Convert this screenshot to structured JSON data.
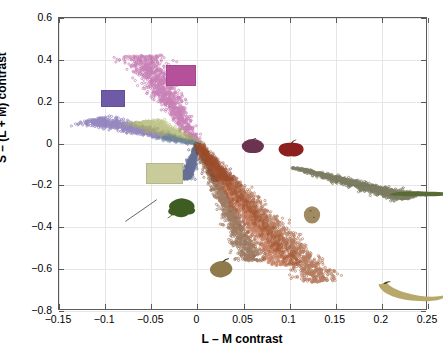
{
  "figure": {
    "xlabel": "L – M contrast",
    "ylabel": "S – (L + M) contrast",
    "background": "#ffffff",
    "axis_color": "#5a5a5a",
    "grid_color": "#e6e6e6"
  },
  "chart_data": {
    "type": "scatter",
    "title": "",
    "xlabel": "L – M contrast",
    "ylabel": "S – (L + M) contrast",
    "xlim": [
      -0.15,
      0.25
    ],
    "ylim": [
      -0.8,
      0.6
    ],
    "xticks": [
      -0.15,
      -0.1,
      -0.05,
      0,
      0.05,
      0.1,
      0.15,
      0.2,
      0.25
    ],
    "xticklabels": [
      "−0.15",
      "−0.1",
      "−0.05",
      "0",
      "0.05",
      "0.1",
      "0.15",
      "0.2",
      "0.25"
    ],
    "yticks": [
      -0.8,
      -0.6,
      -0.4,
      -0.2,
      0,
      0.2,
      0.4,
      0.6
    ],
    "yticklabels": [
      "−0.8",
      "−0.6",
      "−0.4",
      "−0.2",
      "0",
      "0.2",
      "0.4",
      "0.6"
    ],
    "grid": true,
    "legend": "none",
    "marker": "circle-open",
    "marker_size": 2.4,
    "series": [
      {
        "name": "blue-purple-cloud-upper-left",
        "color": "#6f5aa8",
        "n": 900,
        "origin": [
          0.0,
          0.0
        ],
        "direction": [
          -0.115,
          0.115
        ],
        "spread_long": 0.055,
        "spread_perp": 0.022,
        "center": [
          -0.072,
          0.075
        ],
        "x_range": [
          -0.125,
          -0.015
        ],
        "y_range": [
          0.015,
          0.135
        ]
      },
      {
        "name": "magenta-cloud-upper-middle",
        "color": "#b5519b",
        "n": 1100,
        "origin": [
          0.0,
          0.0
        ],
        "direction": [
          -0.062,
          0.42
        ],
        "spread_long": 0.09,
        "spread_perp": 0.02,
        "center": [
          -0.035,
          0.23
        ],
        "x_range": [
          -0.072,
          0.0
        ],
        "y_range": [
          0.02,
          0.44
        ]
      },
      {
        "name": "olive-green-cloud-center",
        "color": "#a8b060",
        "n": 950,
        "origin": [
          0.0,
          0.0
        ],
        "direction": [
          -0.06,
          0.105
        ],
        "spread_long": 0.05,
        "spread_perp": 0.018,
        "center": [
          -0.032,
          0.055
        ],
        "x_range": [
          -0.068,
          0.004
        ],
        "y_range": [
          -0.015,
          0.125
        ]
      },
      {
        "name": "dark-navy-cloud-near-origin",
        "color": "#2b3a6b",
        "n": 600,
        "origin": [
          0.0,
          0.0
        ],
        "direction": [
          -0.012,
          -0.17
        ],
        "spread_long": 0.075,
        "spread_perp": 0.006,
        "center": [
          -0.006,
          -0.09
        ],
        "x_range": [
          -0.016,
          0.004
        ],
        "y_range": [
          -0.19,
          0.01
        ]
      },
      {
        "name": "dark-red-cloud-right-of-origin",
        "color": "#6d2330",
        "n": 750,
        "origin": [
          0.0,
          0.0
        ],
        "direction": [
          0.028,
          -0.175
        ],
        "spread_long": 0.08,
        "spread_perp": 0.009,
        "center": [
          0.015,
          -0.09
        ],
        "x_range": [
          0.0,
          0.032
        ],
        "y_range": [
          -0.2,
          0.005
        ]
      },
      {
        "name": "brown-cloud-steep",
        "color": "#7a4a2a",
        "n": 1200,
        "origin": [
          0.0,
          0.0
        ],
        "direction": [
          0.06,
          -0.56
        ],
        "spread_long": 0.14,
        "spread_perp": 0.012,
        "center": [
          0.033,
          -0.3
        ],
        "x_range": [
          0.005,
          0.068
        ],
        "y_range": [
          -0.62,
          0.01
        ]
      },
      {
        "name": "orange-red-cloud-diagonal",
        "color": "#b0552e",
        "n": 1400,
        "origin": [
          0.0,
          0.0
        ],
        "direction": [
          0.095,
          -0.58
        ],
        "spread_long": 0.15,
        "spread_perp": 0.016,
        "center": [
          0.052,
          -0.31
        ],
        "x_range": [
          0.008,
          0.105
        ],
        "y_range": [
          -0.66,
          0.015
        ]
      },
      {
        "name": "rust-cloud-wide-diagonal",
        "color": "#9a4b24",
        "n": 1500,
        "origin": [
          0.0,
          0.0
        ],
        "direction": [
          0.135,
          -0.66
        ],
        "spread_long": 0.17,
        "spread_perp": 0.02,
        "center": [
          0.072,
          -0.35
        ],
        "x_range": [
          0.012,
          0.15
        ],
        "y_range": [
          -0.73,
          0.02
        ]
      },
      {
        "name": "dark-olive-cloud-shallow-right",
        "color": "#4a4a28",
        "n": 1300,
        "origin": [
          0.105,
          -0.115
        ],
        "direction": [
          0.125,
          -0.145
        ],
        "spread_long": 0.1,
        "spread_perp": 0.016,
        "center": [
          0.168,
          -0.185
        ],
        "x_range": [
          0.1,
          0.235
        ],
        "y_range": [
          -0.27,
          -0.1
        ]
      },
      {
        "name": "sparse-teal-cloud-far-left",
        "color": "#5f7f9a",
        "n": 120,
        "origin": [
          0.0,
          0.0
        ],
        "direction": [
          -0.04,
          0.03
        ],
        "spread_long": 0.02,
        "spread_perp": 0.012,
        "center": [
          -0.1,
          0.1
        ],
        "x_range": [
          -0.125,
          -0.085
        ],
        "y_range": [
          0.06,
          0.14
        ]
      }
    ],
    "color_patches": [
      {
        "name": "patch-violet",
        "color": "#6f5aa8",
        "x": -0.1045,
        "y": 0.255,
        "w": 0.026,
        "h": 0.079
      },
      {
        "name": "patch-magenta",
        "color": "#b5519b",
        "x": -0.0335,
        "y": 0.375,
        "w": 0.032,
        "h": 0.101
      },
      {
        "name": "patch-pale-yellow",
        "color": "#c9cc9a",
        "x": -0.0555,
        "y": -0.095,
        "w": 0.04,
        "h": 0.098
      }
    ],
    "object_thumbnails": [
      {
        "name": "plum",
        "x": 0.045,
        "y": 0.028,
        "w": 0.03,
        "h": 0.075,
        "color": "#6b3350"
      },
      {
        "name": "apple",
        "x": 0.084,
        "y": 0.02,
        "w": 0.035,
        "h": 0.09,
        "color": "#8d1f1f"
      },
      {
        "name": "leaf",
        "x": -0.035,
        "y": -0.255,
        "w": 0.036,
        "h": 0.105,
        "color": "#3d5d22"
      },
      {
        "name": "fig-pear",
        "x": 0.008,
        "y": -0.54,
        "w": 0.035,
        "h": 0.105,
        "color": "#8e7a4a"
      },
      {
        "name": "potato",
        "x": 0.111,
        "y": -0.295,
        "w": 0.026,
        "h": 0.09,
        "color": "#a08a62"
      },
      {
        "name": "courgette",
        "x": 0.205,
        "y": -0.2,
        "w": 0.075,
        "h": 0.055,
        "color": "#5a6b35"
      },
      {
        "name": "banana",
        "x": 0.192,
        "y": -0.65,
        "w": 0.08,
        "h": 0.115,
        "color": "#b8a86a"
      }
    ],
    "annotations": [
      {
        "name": "leaf-pointer-line",
        "from": [
          -0.078,
          -0.372
        ],
        "to": [
          -0.044,
          -0.268
        ],
        "color": "#555555"
      }
    ]
  }
}
